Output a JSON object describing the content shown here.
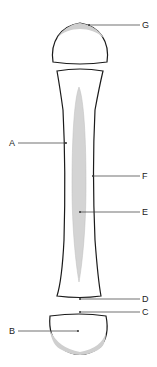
{
  "diagram": {
    "colors": {
      "outline": "#1a1a1a",
      "fill": "#ffffff",
      "cavity": "#d4d4d4",
      "cartilage": "#cfcfcf",
      "leader": "#333333"
    },
    "labels": [
      {
        "id": "A",
        "text": "A"
      },
      {
        "id": "B",
        "text": "B"
      },
      {
        "id": "C",
        "text": "C"
      },
      {
        "id": "D",
        "text": "D"
      },
      {
        "id": "E",
        "text": "E"
      },
      {
        "id": "F",
        "text": "F"
      },
      {
        "id": "G",
        "text": "G"
      }
    ]
  }
}
